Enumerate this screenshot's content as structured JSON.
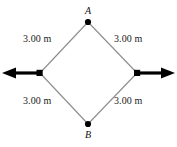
{
  "figure": {
    "background_color": "#ffffff",
    "edge_color": "#8c8c8c",
    "arrow_color": "#000000",
    "vertex_dot_color": "#000000",
    "text_color": "#1a1a1a"
  },
  "vertices": {
    "top": {
      "label": "A",
      "x": 88,
      "y": 22
    },
    "bottom": {
      "label": "B",
      "x": 88,
      "y": 124
    },
    "left": {
      "label": "",
      "x": 40,
      "y": 73
    },
    "right": {
      "label": "",
      "x": 137,
      "y": 73
    }
  },
  "side_labels": {
    "top_left": "3.00 m",
    "top_right": "3.00 m",
    "bottom_left": "3.00 m",
    "bottom_right": "3.00 m"
  },
  "arrows": {
    "left": {
      "name": "left-force-arrow",
      "direction": "left",
      "from_x": 40,
      "to_x": 3,
      "y": 73
    },
    "right": {
      "name": "right-force-arrow",
      "direction": "right",
      "from_x": 137,
      "to_x": 174,
      "y": 73
    }
  }
}
